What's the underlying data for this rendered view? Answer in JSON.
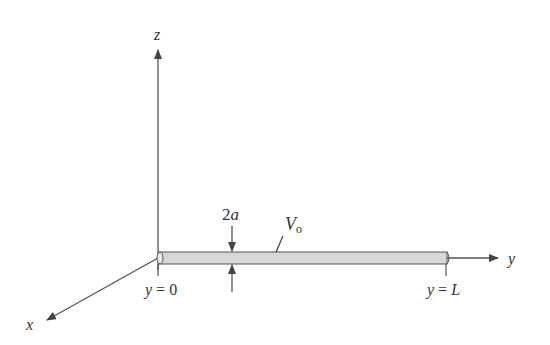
{
  "diagram": {
    "axes": {
      "z_label": "z",
      "y_label": "y",
      "x_label": "x"
    },
    "wire": {
      "radius_label_prefix": "2",
      "radius_label_var": "a",
      "voltage_label_var": "V",
      "voltage_label_sub": "o",
      "start_label_var": "y",
      "start_label_rest": " = 0",
      "end_label_var": "y",
      "end_label_rest": " = ",
      "end_label_val": "L"
    },
    "colors": {
      "line": "#444444",
      "wire_fill": "#d8d8d8",
      "wire_stroke": "#555555"
    }
  }
}
